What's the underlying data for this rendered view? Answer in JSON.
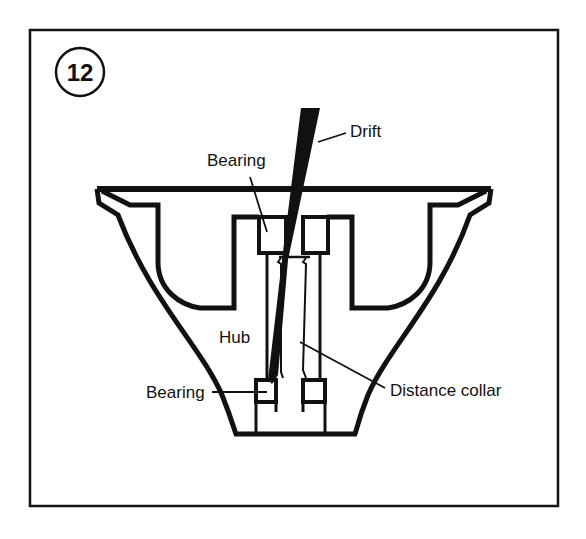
{
  "figure": {
    "number": "12",
    "labels": {
      "drift": "Drift",
      "bearing_top": "Bearing",
      "hub": "Hub",
      "bearing_bottom": "Bearing",
      "distance_collar": "Distance collar"
    },
    "colors": {
      "ink": "#111111",
      "background": "#ffffff"
    }
  }
}
